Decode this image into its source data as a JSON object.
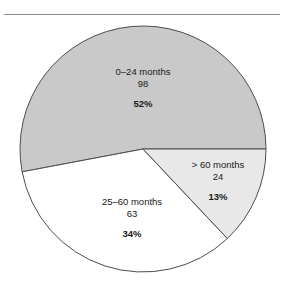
{
  "figure": {
    "has_top_rule": true,
    "rule_color": "#8e8e8e",
    "background": "#ffffff"
  },
  "chart_data": {
    "type": "pie",
    "title": "",
    "subtitle": "",
    "xlabel": "",
    "ylabel": "",
    "legend_position": "none",
    "grid": false,
    "total": 185,
    "center": {
      "x": 143,
      "y": 149
    },
    "radius": 123,
    "start_angle_deg": 0,
    "direction": "counterclockwise",
    "categories": [
      "0–24 months",
      "25–60 months",
      "> 60 months"
    ],
    "values": [
      98,
      63,
      24
    ],
    "percents": [
      52,
      34,
      13
    ],
    "slices": [
      {
        "label": "0–24 months",
        "count": "98",
        "percent": "52%",
        "value": 98,
        "percent_value": 52,
        "fill": "#c9c9c9",
        "stroke": "#4d4d4d"
      },
      {
        "label": "25–60 months",
        "count": "63",
        "percent": "34%",
        "value": 63,
        "percent_value": 34,
        "fill": "#ffffff",
        "stroke": "#4d4d4d"
      },
      {
        "label": "> 60 months",
        "count": "24",
        "percent": "13%",
        "value": 24,
        "percent_value": 13,
        "fill": "#e8e8e8",
        "stroke": "#4d4d4d"
      }
    ]
  }
}
